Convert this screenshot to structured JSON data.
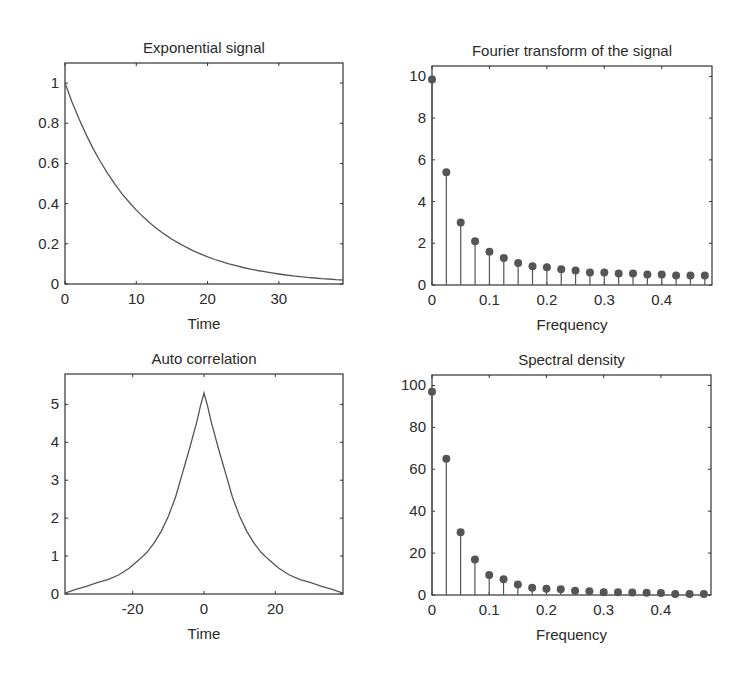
{
  "chart_data": [
    {
      "id": "exp",
      "type": "line",
      "title": "Exponential signal",
      "xlabel": "Time",
      "ylabel": "",
      "xlim": [
        0,
        39
      ],
      "ylim": [
        0,
        1.1
      ],
      "xticks": [
        0,
        10,
        20,
        30
      ],
      "yticks": [
        0,
        0.2,
        0.4,
        0.6,
        0.8,
        1
      ],
      "ytick_labels": [
        "0",
        "0.2",
        "0.4",
        "0.6",
        "0.8",
        "1"
      ],
      "xtick_labels": [
        "0",
        "10",
        "20",
        "30"
      ],
      "grid": false,
      "function": "exp(-t/10)",
      "x": [
        0,
        1,
        2,
        3,
        4,
        5,
        6,
        7,
        8,
        9,
        10,
        11,
        12,
        13,
        14,
        15,
        16,
        17,
        18,
        19,
        20,
        21,
        22,
        23,
        24,
        25,
        26,
        27,
        28,
        29,
        30,
        31,
        32,
        33,
        34,
        35,
        36,
        37,
        38,
        39
      ],
      "values": [
        1.0,
        0.905,
        0.819,
        0.741,
        0.67,
        0.607,
        0.549,
        0.497,
        0.449,
        0.407,
        0.368,
        0.333,
        0.301,
        0.273,
        0.247,
        0.223,
        0.202,
        0.183,
        0.165,
        0.15,
        0.135,
        0.122,
        0.111,
        0.1,
        0.091,
        0.082,
        0.074,
        0.067,
        0.061,
        0.055,
        0.05,
        0.045,
        0.041,
        0.037,
        0.033,
        0.03,
        0.027,
        0.025,
        0.022,
        0.02
      ]
    },
    {
      "id": "fft",
      "type": "stem",
      "title": "Fourier transform of the signal",
      "xlabel": "Frequency",
      "ylabel": "",
      "xlim": [
        0,
        0.4875
      ],
      "ylim": [
        0,
        10.5
      ],
      "xticks": [
        0,
        0.1,
        0.2,
        0.3,
        0.4
      ],
      "xtick_labels": [
        "0",
        "0.1",
        "0.2",
        "0.3",
        "0.4"
      ],
      "yticks": [
        0,
        2,
        4,
        6,
        8,
        10
      ],
      "ytick_labels": [
        "0",
        "2",
        "4",
        "6",
        "8",
        "10"
      ],
      "grid": false,
      "x": [
        0,
        0.025,
        0.05,
        0.075,
        0.1,
        0.125,
        0.15,
        0.175,
        0.2,
        0.225,
        0.25,
        0.275,
        0.3,
        0.325,
        0.35,
        0.375,
        0.4,
        0.425,
        0.45,
        0.475
      ],
      "values": [
        9.85,
        5.4,
        3.0,
        2.1,
        1.6,
        1.3,
        1.05,
        0.9,
        0.85,
        0.75,
        0.7,
        0.6,
        0.6,
        0.55,
        0.55,
        0.5,
        0.5,
        0.45,
        0.45,
        0.45
      ]
    },
    {
      "id": "acorr",
      "type": "line",
      "title": "Auto correlation",
      "xlabel": "Time",
      "ylabel": "",
      "xlim": [
        -39,
        39
      ],
      "ylim": [
        0,
        5.8
      ],
      "xticks": [
        -20,
        0,
        20
      ],
      "xtick_labels": [
        "-20",
        "0",
        "20"
      ],
      "yticks": [
        0,
        1,
        2,
        3,
        4,
        5
      ],
      "ytick_labels": [
        "0",
        "1",
        "2",
        "3",
        "4",
        "5"
      ],
      "grid": false,
      "x": [
        -39,
        -36,
        -33,
        -30,
        -27,
        -24,
        -21,
        -18,
        -16,
        -14,
        -12,
        -10,
        -8,
        -6,
        -4,
        -2,
        -1,
        0,
        1,
        2,
        4,
        6,
        8,
        10,
        12,
        14,
        16,
        18,
        21,
        24,
        27,
        30,
        33,
        36,
        39
      ],
      "values": [
        0.02,
        0.12,
        0.2,
        0.3,
        0.38,
        0.5,
        0.68,
        0.92,
        1.1,
        1.35,
        1.65,
        2.05,
        2.55,
        3.2,
        3.85,
        4.55,
        4.95,
        5.3,
        4.95,
        4.55,
        3.85,
        3.2,
        2.55,
        2.05,
        1.65,
        1.35,
        1.1,
        0.92,
        0.68,
        0.5,
        0.38,
        0.3,
        0.2,
        0.12,
        0.02
      ]
    },
    {
      "id": "psd",
      "type": "stem",
      "title": "Spectral density",
      "xlabel": "Frequency",
      "ylabel": "",
      "xlim": [
        0,
        0.4875
      ],
      "ylim": [
        0,
        105
      ],
      "xticks": [
        0,
        0.1,
        0.2,
        0.3,
        0.4
      ],
      "xtick_labels": [
        "0",
        "0.1",
        "0.2",
        "0.3",
        "0.4"
      ],
      "yticks": [
        0,
        20,
        40,
        60,
        80,
        100
      ],
      "ytick_labels": [
        "0",
        "20",
        "40",
        "60",
        "80",
        "100"
      ],
      "grid": false,
      "x": [
        0,
        0.025,
        0.05,
        0.075,
        0.1,
        0.125,
        0.15,
        0.175,
        0.2,
        0.225,
        0.25,
        0.275,
        0.3,
        0.325,
        0.35,
        0.375,
        0.4,
        0.425,
        0.45,
        0.475
      ],
      "values": [
        97,
        65,
        30,
        17,
        9.5,
        7.5,
        5,
        3.5,
        3,
        2.8,
        2,
        1.8,
        1.3,
        1.3,
        1.2,
        1.1,
        1,
        0.5,
        0.5,
        0.5
      ]
    }
  ],
  "layout": {
    "panels": [
      {
        "left": 65,
        "top": 63,
        "right": 343,
        "bottom": 284
      },
      {
        "left": 432,
        "top": 66,
        "right": 712,
        "bottom": 285
      },
      {
        "left": 65,
        "top": 374,
        "right": 343,
        "bottom": 594
      },
      {
        "left": 432,
        "top": 375,
        "right": 711,
        "bottom": 595
      }
    ],
    "line_color": "#555555",
    "marker_color": "#555555",
    "axis_color": "#333333"
  }
}
